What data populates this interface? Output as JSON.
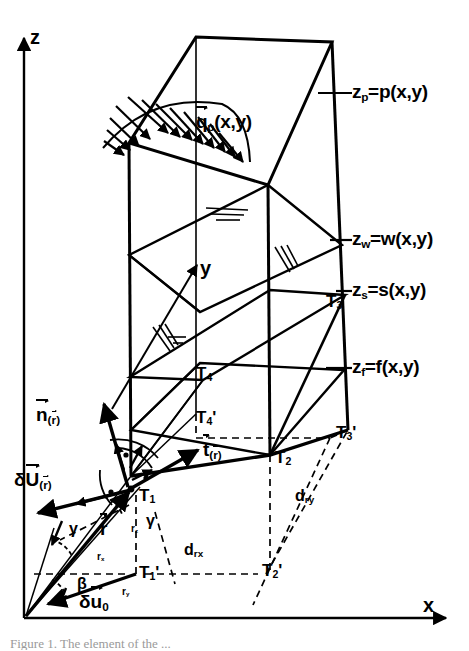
{
  "figure": {
    "title_caption": "Figure 1.  The element of the ...",
    "axes": {
      "z": "z",
      "y": "y",
      "x": "x"
    },
    "surface_labels": [
      {
        "name": "pressure-surface",
        "text": "z",
        "sub": "p",
        "rhs": "=p(x,y)"
      },
      {
        "name": "water-surface",
        "text": "z",
        "sub": "w",
        "rhs": "=w(x,y)"
      },
      {
        "name": "sediment-surface",
        "text": "z",
        "sub": "s",
        "rhs": "=s(x,y)"
      },
      {
        "name": "bottom-surface",
        "text": "z",
        "sub": "f",
        "rhs": "=f(x,y)"
      }
    ],
    "load_label": {
      "base": "q",
      "sub": "p",
      "rhs": "(x,y)"
    },
    "vectors": [
      {
        "name": "normal-vector",
        "base": "n",
        "sub": "r"
      },
      {
        "name": "tangent-vector",
        "base": "t",
        "sub": "r"
      },
      {
        "name": "displacement-vector",
        "prefix": "δ",
        "base": "U",
        "sub": "r"
      },
      {
        "name": "position-vector",
        "base": "r",
        "sub": ""
      },
      {
        "name": "base-displacement",
        "prefix": "δ",
        "base": "u",
        "sub": "0"
      }
    ],
    "angles": [
      {
        "name": "angle-gamma-left",
        "text": "γ"
      },
      {
        "name": "angle-gamma-right",
        "text": "γ"
      },
      {
        "name": "angle-beta",
        "text": "β"
      }
    ],
    "corner_points": [
      {
        "name": "point-t1",
        "base": "T",
        "sub": "1",
        "prime": ""
      },
      {
        "name": "point-t2",
        "base": "T",
        "sub": "2",
        "prime": ""
      },
      {
        "name": "point-t3",
        "base": "T",
        "sub": "3",
        "prime": ""
      },
      {
        "name": "point-t4",
        "base": "T",
        "sub": "4",
        "prime": ""
      },
      {
        "name": "point-t1-prime",
        "base": "T",
        "sub": "1",
        "prime": "'"
      },
      {
        "name": "point-t2-prime",
        "base": "T",
        "sub": "2",
        "prime": "'"
      },
      {
        "name": "point-t3-prime",
        "base": "T",
        "sub": "3",
        "prime": "'"
      },
      {
        "name": "point-t4-prime",
        "base": "T",
        "sub": "4",
        "prime": "'"
      }
    ],
    "dimensions": [
      {
        "name": "dim-drx",
        "base": "d",
        "sub": "rx"
      },
      {
        "name": "dim-dry",
        "base": "d",
        "sub": "ry"
      }
    ],
    "components": [
      {
        "name": "component-rx",
        "base": "r",
        "sub": "x"
      },
      {
        "name": "component-ry",
        "base": "r",
        "sub": "y"
      },
      {
        "name": "component-rz",
        "base": "r",
        "sub": "z"
      }
    ],
    "colors": {
      "ink": "#000000",
      "paper": "#ffffff",
      "caption": "#9a9a9a"
    }
  }
}
